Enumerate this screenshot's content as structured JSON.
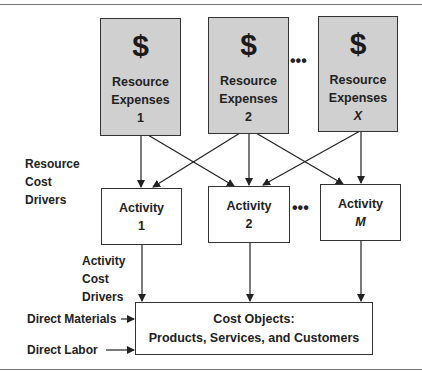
{
  "diagram": {
    "resources": [
      {
        "symbol": "$",
        "line1": "Resource",
        "line2": "Expenses",
        "index": "1"
      },
      {
        "symbol": "$",
        "line1": "Resource",
        "line2": "Expenses",
        "index": "2"
      },
      {
        "symbol": "$",
        "line1": "Resource",
        "line2": "Expenses",
        "index": "X"
      }
    ],
    "activities": [
      {
        "label": "Activity",
        "index": "1"
      },
      {
        "label": "Activity",
        "index": "2"
      },
      {
        "label": "Activity",
        "index": "M"
      }
    ],
    "ellipsis": "•••",
    "resource_cost_drivers": [
      "Resource",
      "Cost",
      "Drivers"
    ],
    "activity_cost_drivers": [
      "Activity",
      "Cost",
      "Drivers"
    ],
    "direct_materials": "Direct Materials",
    "direct_labor": "Direct Labor",
    "cost_objects": {
      "title": "Cost Objects:",
      "subtitle": "Products, Services, and Customers"
    },
    "colors": {
      "resource_fill": "#d0d0d0",
      "border": "#333333",
      "arrow": "#222222"
    }
  }
}
